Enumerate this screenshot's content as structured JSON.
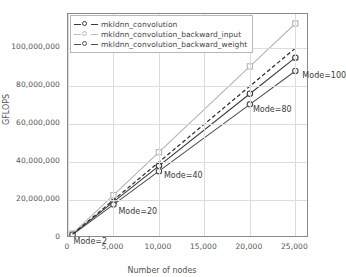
{
  "chart_data": {
    "type": "line",
    "title": "",
    "xlabel": "Number of nodes",
    "ylabel": "GFLOPS",
    "xlim": [
      0,
      26500
    ],
    "ylim": [
      0,
      118000000
    ],
    "grid": true,
    "legend_position": "top-left",
    "xticks": [
      0,
      5000,
      10000,
      15000,
      20000,
      25000
    ],
    "xticklabels": [
      "0",
      "5,000",
      "10,000",
      "15,000",
      "20,000",
      "25,000"
    ],
    "yticks": [
      0,
      20000000,
      40000000,
      60000000,
      80000000,
      100000000
    ],
    "yticklabels": [
      "0",
      "20,000,000",
      "40,000,000",
      "60,000,000",
      "80,000,000",
      "100,000,000"
    ],
    "x": [
      500,
      5000,
      10000,
      20000,
      25000
    ],
    "series": [
      {
        "name": "mkldnn_convolution",
        "color": "#3a3a3a",
        "style": "solid",
        "marker": "circle",
        "values": [
          1900000,
          19000000,
          38000000,
          76000000,
          95000000
        ]
      },
      {
        "name": "mkldnn_convolution_backward_input",
        "color": "#b4b4b4",
        "style": "solid",
        "marker": "square",
        "values": [
          2300000,
          22600000,
          45200000,
          90400000,
          113000000
        ]
      },
      {
        "name": "mkldnn_convolution_backward_weight",
        "color": "#4f4f4f",
        "style": "solid",
        "marker": "circle",
        "values": [
          1750000,
          17600000,
          35200000,
          70400000,
          88000000
        ]
      },
      {
        "name": "ideal",
        "color": "#2a2a2a",
        "style": "dashed",
        "marker": "none",
        "values": [
          2000000,
          20000000,
          40000000,
          80000000,
          100000000
        ]
      }
    ],
    "annotations": [
      {
        "text": "Mode=2",
        "x": 500,
        "y": 1900000
      },
      {
        "text": "Mode=20",
        "x": 5000,
        "y": 19000000
      },
      {
        "text": "Mode=40",
        "x": 10000,
        "y": 38000000
      },
      {
        "text": "Mode=80",
        "x": 20000,
        "y": 76000000
      },
      {
        "text": "Mode=100",
        "x": 25000,
        "y": 95000000
      }
    ]
  },
  "legend": {
    "entries": [
      "mkldnn_convolution",
      "mkldnn_convolution_backward_input",
      "mkldnn_convolution_backward_weight"
    ]
  }
}
